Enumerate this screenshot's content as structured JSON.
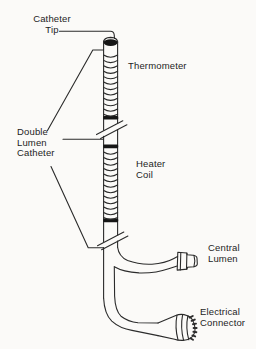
{
  "labels": {
    "catheter_tip": {
      "line1": "Catheter",
      "line2": "Tip"
    },
    "thermometer": {
      "line1": "Thermometer"
    },
    "double_lumen_catheter": {
      "line1": "Double",
      "line2": "Lumen",
      "line3": "Catheter"
    },
    "heater_coil": {
      "line1": "Heater",
      "line2": "Coil"
    },
    "central_lumen": {
      "line1": "Central",
      "line2": "Lumen"
    },
    "electrical_connector": {
      "line1": "Electrical",
      "line2": "Connector"
    }
  },
  "colors": {
    "background": "#fbfaf8",
    "line": "#2b2b2b",
    "text": "#1d1d1d",
    "band": "#161616"
  }
}
